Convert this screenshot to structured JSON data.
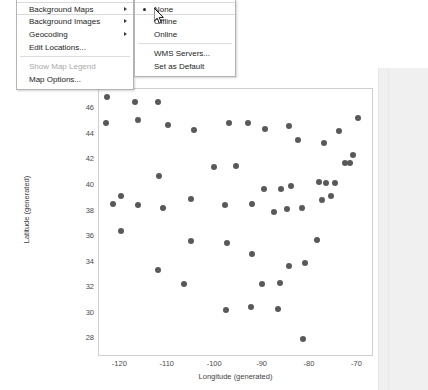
{
  "chart_data": {
    "type": "scatter",
    "title": "",
    "xlabel": "Longitude (generated)",
    "ylabel": "Latitude (generated)",
    "xlim": [
      -124.5,
      -66.5
    ],
    "ylim": [
      26.6,
      47.6
    ],
    "xticks": [
      -120,
      -110,
      -100,
      -90,
      -80,
      -70
    ],
    "xtick_labels": [
      "-120",
      "-110",
      "-100",
      "-90",
      "-80",
      "-70"
    ],
    "yticks": [
      46,
      44,
      42,
      40,
      38,
      36,
      34,
      32,
      30,
      28
    ],
    "ytick_labels": [
      "46",
      "44",
      "42",
      "40",
      "38",
      "36",
      "34",
      "32",
      "30",
      "28"
    ],
    "grid": false,
    "legend": false,
    "marker_color": "#595959",
    "marker_size": 6,
    "points": [
      [
        -122.9,
        47.0
      ],
      [
        -117.0,
        46.6
      ],
      [
        -112.0,
        46.6
      ],
      [
        -123.0,
        44.9
      ],
      [
        -116.2,
        45.2
      ],
      [
        -110.0,
        44.8
      ],
      [
        -104.5,
        44.4
      ],
      [
        -97.0,
        44.9
      ],
      [
        -93.1,
        44.9
      ],
      [
        -89.4,
        44.5
      ],
      [
        -84.5,
        44.7
      ],
      [
        -82.6,
        43.6
      ],
      [
        -77.0,
        43.4
      ],
      [
        -73.8,
        44.3
      ],
      [
        -69.8,
        45.3
      ],
      [
        -119.8,
        39.2
      ],
      [
        -111.9,
        40.8
      ],
      [
        -100.3,
        41.5
      ],
      [
        -95.7,
        41.6
      ],
      [
        -89.6,
        39.8
      ],
      [
        -86.2,
        39.8
      ],
      [
        -84.1,
        40.0
      ],
      [
        -78.0,
        40.3
      ],
      [
        -76.6,
        40.2
      ],
      [
        -75.5,
        39.2
      ],
      [
        -74.7,
        40.2
      ],
      [
        -72.7,
        41.8
      ],
      [
        -71.5,
        41.8
      ],
      [
        -71.0,
        42.4
      ],
      [
        -121.5,
        38.6
      ],
      [
        -116.2,
        38.5
      ],
      [
        -111.0,
        38.3
      ],
      [
        -105.0,
        39.0
      ],
      [
        -98.0,
        38.5
      ],
      [
        -92.2,
        38.6
      ],
      [
        -87.5,
        38.0
      ],
      [
        -84.9,
        38.2
      ],
      [
        -81.6,
        38.3
      ],
      [
        -77.5,
        38.9
      ],
      [
        -119.8,
        36.5
      ],
      [
        -105.0,
        35.7
      ],
      [
        -97.5,
        35.5
      ],
      [
        -92.3,
        34.7
      ],
      [
        -86.3,
        32.4
      ],
      [
        -84.4,
        33.7
      ],
      [
        -81.0,
        34.0
      ],
      [
        -78.6,
        35.8
      ],
      [
        -112.1,
        33.4
      ],
      [
        -106.5,
        32.3
      ],
      [
        -97.7,
        30.3
      ],
      [
        -92.5,
        30.5
      ],
      [
        -90.2,
        32.3
      ],
      [
        -86.8,
        30.4
      ],
      [
        -81.5,
        28.0
      ]
    ]
  },
  "menu": {
    "root_items": [
      {
        "label": "Background Maps",
        "has_submenu": true,
        "disabled": false,
        "highlighted": true
      },
      {
        "label": "Background Images",
        "has_submenu": true,
        "disabled": false,
        "highlighted": false
      },
      {
        "label": "Geocoding",
        "has_submenu": true,
        "disabled": false,
        "highlighted": false
      },
      {
        "label": "Edit Locations...",
        "has_submenu": false,
        "disabled": false,
        "highlighted": false
      },
      {
        "label": "Show Map Legend",
        "has_submenu": false,
        "disabled": true,
        "highlighted": false
      },
      {
        "label": "Map Options...",
        "has_submenu": false,
        "disabled": false,
        "highlighted": false
      }
    ],
    "submenu_items": [
      {
        "label": "None",
        "selected": true
      },
      {
        "label": "Offline",
        "selected": false
      },
      {
        "label": "Online",
        "selected": false
      },
      {
        "label": "WMS Servers...",
        "selected": false
      },
      {
        "label": "Set as Default",
        "selected": false
      }
    ]
  },
  "colors": {
    "marker": "#595959",
    "menu_border": "#b4b4b4",
    "panel_bg": "#f0f0f0",
    "plot_border": "#cfcfcf",
    "disabled_text": "#a9a9a9"
  }
}
